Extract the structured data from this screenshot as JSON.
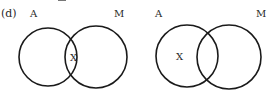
{
  "option_label": "(d)",
  "diagrams": [
    {
      "id": "left",
      "set_a_label": "A",
      "set_m_label": "M",
      "x_marker": "X",
      "x_region": "intersection of A and M"
    },
    {
      "id": "right",
      "set_a_label": "A",
      "set_m_label": "M",
      "x_marker": "X",
      "x_region": "A only (outside M)"
    }
  ],
  "colors": {
    "stroke": "#1a1a1a",
    "text": "#2a2a2a",
    "background": "#ffffff"
  }
}
